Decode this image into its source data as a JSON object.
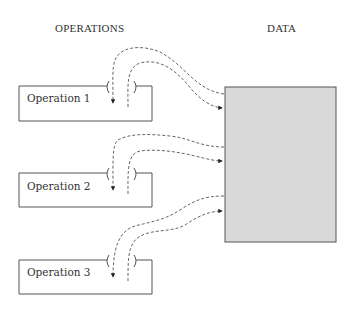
{
  "headings": {
    "operations": "OPERATIONS",
    "data": "DATA"
  },
  "operations": [
    {
      "label": "Operation 1"
    },
    {
      "label": "Operation 2"
    },
    {
      "label": "Operation 3"
    }
  ],
  "colors": {
    "data_fill": "#d9d9d9",
    "stroke": "#555555",
    "text": "#333333"
  }
}
